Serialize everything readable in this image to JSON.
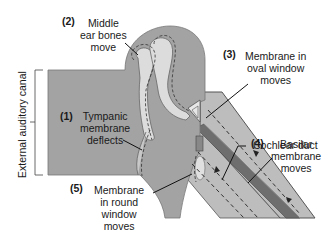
{
  "colors": {
    "tissue": "#a3a3a3",
    "bone": "#dcdcdc",
    "cochlea_fluid": "#bdbdbd",
    "cochlear_duct": "#6e6e6e",
    "outline": "#555555",
    "text": "#1a1a1a"
  },
  "axis_label": "External auditory canal",
  "steps": [
    {
      "num": "(1)",
      "lines": [
        "Tympanic",
        "membrane",
        "deflects"
      ]
    },
    {
      "num": "(2)",
      "lines": [
        "Middle",
        "ear bones",
        "move"
      ]
    },
    {
      "num": "(3)",
      "lines": [
        "Membrane in",
        "oval window",
        "moves"
      ]
    },
    {
      "num": "(4)",
      "lines": [
        "Basilar",
        "membrane",
        "moves"
      ]
    },
    {
      "num": "(5)",
      "lines": [
        "Membrane",
        "in round",
        "window",
        "moves"
      ]
    }
  ],
  "cochlear_duct_label": "Cochlear duct"
}
